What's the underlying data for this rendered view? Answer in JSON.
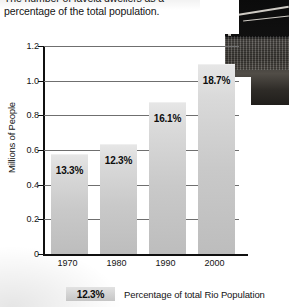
{
  "caption": {
    "line1": "The number of favela dwellers as a",
    "line2": "percentage of the total population."
  },
  "photo": {
    "alt_name": "favela-photograph"
  },
  "chart_data": {
    "type": "bar",
    "title": "",
    "xlabel": "",
    "ylabel": "Millions of People",
    "categories": [
      "1970",
      "1980",
      "1990",
      "2000"
    ],
    "values": [
      0.57,
      0.63,
      0.87,
      1.09
    ],
    "data_labels": [
      "13.3%",
      "12.3%",
      "16.1%",
      "18.7%"
    ],
    "yticks": [
      "0",
      "0.2",
      "0.4",
      "0.6",
      "0.8",
      "1.0",
      "1.2"
    ],
    "ytick_values": [
      0,
      0.2,
      0.4,
      0.6,
      0.8,
      1.0,
      1.2
    ],
    "ylim": [
      0,
      1.2
    ],
    "grid": true,
    "legend_position": "bottom",
    "bar_color": "#cfcfcf",
    "axis_color": "#101010",
    "grid_color": "#6f6f6f"
  },
  "legend": {
    "swatch_label": "12.3%",
    "description": "Percentage of total Rio Population"
  }
}
